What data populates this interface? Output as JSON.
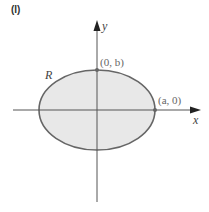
{
  "panel_label": "(I)",
  "axes": {
    "x_label": "x",
    "y_label": "y"
  },
  "region_label": "R",
  "points": [
    {
      "label": "(0, b)",
      "name": "point-0-b"
    },
    {
      "label": "(a, 0)",
      "name": "point-a-0"
    }
  ],
  "colors": {
    "ellipse_fill": "#e8e8e8",
    "ellipse_stroke": "#666666",
    "axis": "#555555",
    "point": "#666666"
  }
}
